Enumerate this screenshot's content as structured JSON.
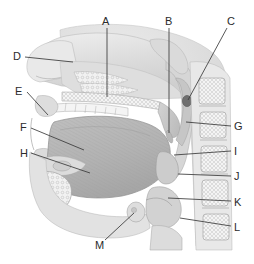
{
  "figure": {
    "background_color": "#ffffff",
    "ink_color": "#2b2b2b",
    "tone_light": "#e6e6e6",
    "tone_mid": "#c8c8c8",
    "tone_dark": "#9a9a9a",
    "tone_bone": "#f2f2f2"
  },
  "labels": [
    {
      "id": "A",
      "text": "A",
      "x": 102,
      "y": 16,
      "line": {
        "x1": 107,
        "y1": 28,
        "x2": 107,
        "y2": 97
      }
    },
    {
      "id": "B",
      "text": "B",
      "x": 165,
      "y": 16,
      "line": {
        "x1": 169,
        "y1": 28,
        "x2": 169,
        "y2": 133
      }
    },
    {
      "id": "C",
      "text": "C",
      "x": 227,
      "y": 16,
      "line": {
        "x1": 227,
        "y1": 28,
        "x2": 188,
        "y2": 100
      }
    },
    {
      "id": "D",
      "text": "D",
      "x": 13,
      "y": 51,
      "line": {
        "x1": 25,
        "y1": 57,
        "x2": 73,
        "y2": 62
      }
    },
    {
      "id": "E",
      "text": "E",
      "x": 15,
      "y": 86,
      "line": {
        "x1": 27,
        "y1": 92,
        "x2": 48,
        "y2": 115
      }
    },
    {
      "id": "F",
      "text": "F",
      "x": 20,
      "y": 122,
      "line": {
        "x1": 31,
        "y1": 128,
        "x2": 84,
        "y2": 150
      }
    },
    {
      "id": "G",
      "text": "G",
      "x": 234,
      "y": 121,
      "line": {
        "x1": 231,
        "y1": 126,
        "x2": 186,
        "y2": 122
      }
    },
    {
      "id": "H",
      "text": "H",
      "x": 20,
      "y": 148,
      "line": {
        "x1": 31,
        "y1": 153,
        "x2": 90,
        "y2": 173
      }
    },
    {
      "id": "I",
      "text": "I",
      "x": 234,
      "y": 146,
      "line": {
        "x1": 231,
        "y1": 151,
        "x2": 174,
        "y2": 155
      }
    },
    {
      "id": "J",
      "text": "J",
      "x": 234,
      "y": 171,
      "line": {
        "x1": 231,
        "y1": 176,
        "x2": 178,
        "y2": 174
      }
    },
    {
      "id": "K",
      "text": "K",
      "x": 234,
      "y": 197,
      "line": {
        "x1": 231,
        "y1": 201,
        "x2": 168,
        "y2": 198
      }
    },
    {
      "id": "L",
      "text": "L",
      "x": 234,
      "y": 222,
      "line": {
        "x1": 231,
        "y1": 226,
        "x2": 180,
        "y2": 218
      }
    },
    {
      "id": "M",
      "text": "M",
      "x": 95,
      "y": 240,
      "line": {
        "x1": 105,
        "y1": 240,
        "x2": 134,
        "y2": 213
      }
    }
  ]
}
